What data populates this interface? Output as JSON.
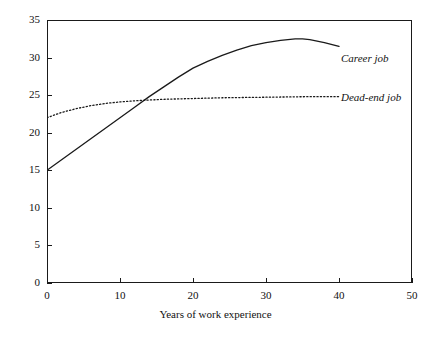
{
  "chart_data": {
    "type": "line",
    "title": "",
    "subtitle": "",
    "xlabel": "Years of work experience",
    "ylabel": "",
    "xlim": [
      0,
      50
    ],
    "ylim": [
      0,
      35
    ],
    "xticks": [
      0,
      10,
      20,
      30,
      40,
      50
    ],
    "yticks": [
      0,
      5,
      10,
      15,
      20,
      25,
      30,
      35
    ],
    "xtick_labels": [
      "0",
      "10",
      "20",
      "30",
      "40",
      "50"
    ],
    "ytick_labels": [
      "0",
      "5",
      "10",
      "15",
      "20",
      "25",
      "30",
      "35"
    ],
    "grid": false,
    "legend_position": "inline-annotation-right",
    "frame": "box",
    "series": [
      {
        "name": "Career job",
        "style": "solid",
        "color": "#1a1a1a",
        "x": [
          0,
          2,
          4,
          6,
          8,
          10,
          12,
          14,
          16,
          18,
          20,
          22,
          24,
          26,
          28,
          30,
          32,
          34,
          35,
          36,
          38,
          40
        ],
        "values": [
          15.0,
          16.4,
          17.8,
          19.2,
          20.6,
          22.0,
          23.4,
          24.8,
          26.1,
          27.4,
          28.6,
          29.5,
          30.3,
          31.0,
          31.6,
          32.0,
          32.3,
          32.5,
          32.5,
          32.4,
          32.0,
          31.5
        ]
      },
      {
        "name": "Dead-end job",
        "style": "dotted",
        "color": "#1a1a1a",
        "x": [
          0,
          2,
          4,
          6,
          8,
          10,
          12,
          14,
          16,
          18,
          20,
          24,
          28,
          32,
          36,
          40
        ],
        "values": [
          22.0,
          22.7,
          23.2,
          23.6,
          23.9,
          24.1,
          24.25,
          24.35,
          24.45,
          24.5,
          24.55,
          24.65,
          24.7,
          24.75,
          24.8,
          24.8
        ]
      }
    ],
    "annotations": [
      {
        "text": "Career job",
        "series": "Career job"
      },
      {
        "text": "Dead-end job",
        "series": "Dead-end job"
      }
    ]
  }
}
